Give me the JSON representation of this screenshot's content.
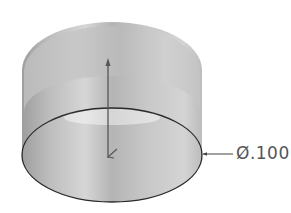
{
  "diagram": {
    "type": "cylinder-shell-3d",
    "dimension": {
      "label": "Ø.100",
      "symbol": "diameter",
      "value": ".100"
    },
    "colors": {
      "surface_dark": "#a8a8a8",
      "surface_light": "#d8d8d8",
      "outline": "#2a2a2a",
      "axis": "#555555",
      "leader": "#444444",
      "text": "#555555",
      "background": "#ffffff"
    }
  }
}
